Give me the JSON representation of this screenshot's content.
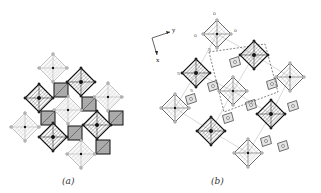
{
  "figure": {
    "panels": [
      {
        "id": "a",
        "label": "(a)",
        "description": "Corner-sharing octahedral framework, polyhedral view",
        "octahedra": [
          {
            "cx": 53,
            "cy": 68,
            "r": 14,
            "shade": "light"
          },
          {
            "cx": 81,
            "cy": 82,
            "r": 14,
            "shade": "dark"
          },
          {
            "cx": 39,
            "cy": 98,
            "r": 14,
            "shade": "dark"
          },
          {
            "cx": 108,
            "cy": 97,
            "r": 14,
            "shade": "light"
          },
          {
            "cx": 68,
            "cy": 110,
            "r": 14,
            "shade": "light"
          },
          {
            "cx": 25,
            "cy": 127,
            "r": 14,
            "shade": "light"
          },
          {
            "cx": 97,
            "cy": 125,
            "r": 14,
            "shade": "dark"
          },
          {
            "cx": 53,
            "cy": 137,
            "r": 14,
            "shade": "dark"
          },
          {
            "cx": 81,
            "cy": 154,
            "r": 14,
            "shade": "light"
          }
        ],
        "squares": [
          {
            "x": 54,
            "y": 83,
            "s": 14
          },
          {
            "x": 82,
            "y": 97,
            "s": 14
          },
          {
            "x": 41,
            "y": 111,
            "s": 14
          },
          {
            "x": 68,
            "y": 126,
            "s": 14
          },
          {
            "x": 109,
            "y": 111,
            "s": 14
          },
          {
            "x": 96,
            "y": 140,
            "s": 14
          }
        ]
      },
      {
        "id": "b",
        "label": "(b)",
        "description": "Rotated structural view with axes and labelled atoms",
        "axes": {
          "x_label": "x",
          "y_label": "y"
        },
        "octahedra": [
          {
            "cx": 217,
            "cy": 34,
            "r": 14,
            "shade": "hatched"
          },
          {
            "cx": 254,
            "cy": 55,
            "r": 14,
            "shade": "hatched-dark"
          },
          {
            "cx": 196,
            "cy": 73,
            "r": 14,
            "shade": "hatched-dark"
          },
          {
            "cx": 290,
            "cy": 77,
            "r": 14,
            "shade": "hatched"
          },
          {
            "cx": 233,
            "cy": 91,
            "r": 14,
            "shade": "hatched"
          },
          {
            "cx": 271,
            "cy": 114,
            "r": 14,
            "shade": "hatched-dark"
          },
          {
            "cx": 175,
            "cy": 108,
            "r": 14,
            "shade": "hatched"
          },
          {
            "cx": 211,
            "cy": 131,
            "r": 14,
            "shade": "hatched-dark"
          },
          {
            "cx": 248,
            "cy": 153,
            "r": 14,
            "shade": "hatched"
          }
        ],
        "squares": [
          {
            "cx": 235,
            "cy": 62,
            "s": 11
          },
          {
            "cx": 213,
            "cy": 86,
            "s": 11
          },
          {
            "cx": 272,
            "cy": 84,
            "s": 11
          },
          {
            "cx": 251,
            "cy": 105,
            "s": 11
          },
          {
            "cx": 293,
            "cy": 106,
            "s": 11
          },
          {
            "cx": 228,
            "cy": 118,
            "s": 11
          },
          {
            "cx": 191,
            "cy": 99,
            "s": 11
          },
          {
            "cx": 266,
            "cy": 141,
            "s": 11
          },
          {
            "cx": 283,
            "cy": 146,
            "s": 11
          }
        ],
        "atom_labels": [
          {
            "x": 213,
            "y": 15,
            "text": "O"
          },
          {
            "x": 194,
            "y": 37,
            "text": "O"
          },
          {
            "x": 234,
            "y": 32,
            "text": "O"
          },
          {
            "x": 208,
            "y": 51,
            "text": "Ti"
          },
          {
            "x": 177,
            "y": 75,
            "text": "Ti"
          },
          {
            "x": 190,
            "y": 92,
            "text": "Ti"
          }
        ],
        "dashed_cell": [
          [
            209,
            52
          ],
          [
            265,
            44
          ],
          [
            278,
            92
          ],
          [
            224,
            112
          ]
        ]
      }
    ]
  }
}
